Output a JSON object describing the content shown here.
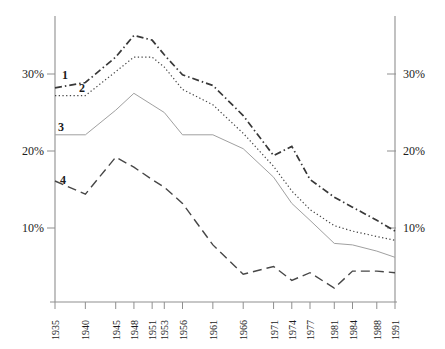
{
  "figure": {
    "background": "#ffffff",
    "axis_color": "#8f8f8f",
    "text_color": "#1c1c1c"
  },
  "chart_data": {
    "type": "line",
    "title": "",
    "xlabel": "",
    "ylabel": "",
    "grid": false,
    "legend_position": "inline-left",
    "xlim": [
      1935,
      1991
    ],
    "ylim": [
      0,
      37
    ],
    "x_values": [
      1935,
      1940,
      1945,
      1948,
      1951,
      1953,
      1956,
      1961,
      1966,
      1971,
      1974,
      1977,
      1981,
      1984,
      1988,
      1991
    ],
    "x_tick_labels": [
      "1935",
      "1940",
      "1945",
      "1948",
      "1951",
      "1953",
      "1956",
      "1961",
      "1966",
      "1971",
      "1974",
      "1977",
      "1981",
      "1984",
      "1988",
      "1991"
    ],
    "y_tick_values": [
      30,
      20,
      10
    ],
    "y_tick_labels_left": [
      "30%",
      "20%",
      "10%"
    ],
    "y_tick_labels_right": [
      "30%",
      "20%",
      "10%"
    ],
    "series": [
      {
        "name": "series-1",
        "label": "1",
        "style": "dash-dot",
        "color": "#383838",
        "values": [
          28.2,
          28.9,
          32.2,
          35.0,
          34.4,
          32.5,
          29.9,
          28.5,
          24.6,
          19.4,
          20.6,
          16.3,
          14.0,
          12.7,
          11.0,
          9.6
        ]
      },
      {
        "name": "series-2",
        "label": "2",
        "style": "dotted",
        "color": "#474747",
        "values": [
          27.2,
          27.2,
          30.3,
          32.2,
          32.2,
          30.9,
          28.0,
          26.0,
          22.3,
          18.0,
          14.8,
          12.4,
          10.3,
          9.6,
          8.9,
          8.4
        ]
      },
      {
        "name": "series-3",
        "label": "3",
        "style": "solid",
        "color": "#a0a0a0",
        "values": [
          22.1,
          22.1,
          25.3,
          27.5,
          26.0,
          25.0,
          22.1,
          22.1,
          20.3,
          16.6,
          13.2,
          11.0,
          8.0,
          7.8,
          7.0,
          6.2
        ]
      },
      {
        "name": "series-4",
        "label": "4",
        "style": "dashed",
        "color": "#474747",
        "values": [
          16.1,
          14.4,
          19.2,
          17.9,
          16.3,
          15.3,
          13.2,
          7.8,
          4.0,
          5.0,
          3.2,
          4.2,
          2.2,
          4.4,
          4.4,
          4.2
        ]
      }
    ]
  }
}
